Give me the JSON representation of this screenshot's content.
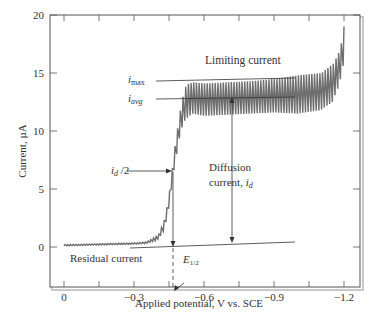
{
  "chart_data": {
    "type": "line",
    "title": "",
    "xlabel": "Applied potential, V vs. SCE",
    "ylabel": "Current, µA",
    "xlim": [
      0.05,
      -1.25
    ],
    "ylim": [
      -3.5,
      20
    ],
    "x_ticks": [
      "0",
      "−0.3",
      "−0.6",
      "−0.9",
      "−1.2"
    ],
    "y_ticks": [
      "0",
      "5",
      "10",
      "15",
      "20"
    ],
    "grid": false,
    "series": [
      {
        "name": "Polarogram (oscillating current)",
        "x": [
          0,
          -0.1,
          -0.2,
          -0.3,
          -0.35,
          -0.4,
          -0.43,
          -0.45,
          -0.47,
          -0.5,
          -0.52,
          -0.55,
          -0.6,
          -0.7,
          -0.8,
          -0.9,
          -1.0,
          -1.1,
          -1.15,
          -1.18,
          -1.2
        ],
        "y_min": [
          0.1,
          0.15,
          0.2,
          0.25,
          0.3,
          0.6,
          1.5,
          3.5,
          6.5,
          10.0,
          11.0,
          11.5,
          11.3,
          11.4,
          11.5,
          11.6,
          11.5,
          11.8,
          12.5,
          14.0,
          16.0
        ],
        "y_max": [
          0.2,
          0.25,
          0.3,
          0.35,
          0.45,
          1.0,
          2.5,
          5.0,
          8.5,
          12.5,
          14.0,
          14.2,
          14.1,
          14.2,
          14.3,
          14.5,
          14.8,
          15.0,
          15.8,
          17.0,
          19.5
        ]
      }
    ],
    "annotations": {
      "limiting_current": "Limiting current",
      "i_max": "i",
      "i_max_sub": "max",
      "i_avg": "i",
      "i_avg_sub": "avg",
      "half_id": "i",
      "half_id_sub": "d",
      "half_id_suffix": " /2",
      "diffusion_line1": "Diffusion",
      "diffusion_line2": "current, ",
      "diffusion_i": "i",
      "diffusion_sub": "d",
      "residual_current": "Residual current",
      "e_half": "E",
      "e_half_sub": "1/2"
    },
    "reference_values": {
      "i_max": 14.5,
      "i_avg": 13.0,
      "residual_baseline_at_0": 0.0,
      "residual_baseline_at_-0.9": 0.6,
      "E_half": -0.48
    }
  }
}
